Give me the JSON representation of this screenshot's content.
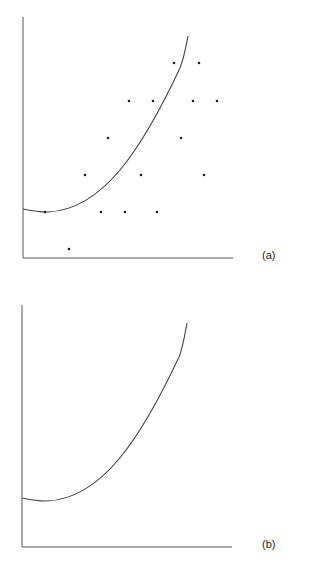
{
  "chart_data": [
    {
      "type": "scatter",
      "panel_label": "(a)",
      "title": "",
      "xlabel": "",
      "ylabel": "",
      "grid": false,
      "axes_px": {
        "x0": 23,
        "y0": 258,
        "x1": 233,
        "ytop": 17
      },
      "points_px": [
        [
          174,
          63
        ],
        [
          199,
          63
        ],
        [
          129,
          101
        ],
        [
          153,
          101
        ],
        [
          193,
          101
        ],
        [
          217,
          101
        ],
        [
          108,
          138
        ],
        [
          181,
          138
        ],
        [
          85,
          175
        ],
        [
          141,
          175
        ],
        [
          204,
          175
        ],
        [
          45,
          212
        ],
        [
          101,
          212
        ],
        [
          125,
          212
        ],
        [
          157,
          212
        ],
        [
          69,
          249
        ]
      ],
      "curve_path": "M23,209 C33,211 40,212.5 48,212 C70,211 95,200 120,170 C145,140 165,100 180,68 C184,58 186,46 188,36",
      "curve_description": "fitted convex (quadratic-like) curve rising steeply to the right"
    },
    {
      "type": "line",
      "panel_label": "(b)",
      "title": "",
      "xlabel": "",
      "ylabel": "",
      "grid": false,
      "axes_px": {
        "x0": 22,
        "y0": 547,
        "x1": 232,
        "ytop": 305
      },
      "points_px": [],
      "curve_path": "M22,498 C32,500 39,501.5 47,501 C69,500 94,489 119,459 C144,429 164,389 179,357 C183,347 185,334 187,323",
      "curve_description": "same fitted convex curve shown without data points"
    }
  ]
}
